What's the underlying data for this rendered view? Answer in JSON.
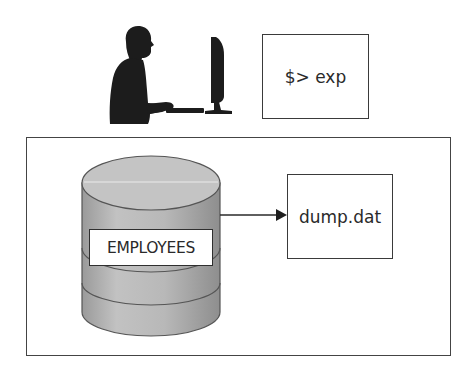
{
  "diagram": {
    "actor": {
      "icon": "user-at-computer-icon",
      "description": "Silhouette of a person typing at a computer"
    },
    "terminal": {
      "command": "$> exp"
    },
    "database_server": {
      "database": {
        "icon": "database-cylinder-icon",
        "table_label": "EMPLOYEES"
      },
      "arrow": {
        "from": "EMPLOYEES",
        "to": "dump.dat"
      },
      "dump_file": {
        "name": "dump.dat"
      }
    },
    "colors": {
      "stroke": "#3a3a3a",
      "silhouette": "#1c1c1c",
      "cylinder_fill": "#b5b5b5",
      "cylinder_top": "#c4c4c4",
      "background": "#ffffff"
    }
  }
}
